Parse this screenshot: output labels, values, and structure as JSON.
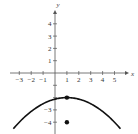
{
  "chart_data": {
    "type": "line",
    "title": "",
    "xlabel": "x",
    "ylabel": "y",
    "xlim": [
      -3.5,
      5.8
    ],
    "ylim": [
      -4.7,
      5
    ],
    "x_ticks": [
      -3,
      -2,
      -1,
      1,
      2,
      3,
      4,
      5
    ],
    "x_tick_labels": [
      "−3",
      "−2",
      "−1",
      "1",
      "2",
      "3",
      "4",
      "5"
    ],
    "y_ticks": [
      -4,
      -3,
      -2,
      -1,
      1,
      2,
      3,
      4
    ],
    "y_tick_labels_shown": [
      {
        "value": 4,
        "label": "4"
      },
      {
        "value": 3,
        "label": "3"
      },
      {
        "value": 2,
        "label": "2"
      },
      {
        "value": 1,
        "label": "1"
      },
      {
        "value": -3,
        "label": "−3"
      },
      {
        "value": -4,
        "label": "−4"
      }
    ],
    "grid": false,
    "series": [
      {
        "name": "parabola",
        "equation": "y = -(1/8)(x-1)^2 - 2",
        "vertex": [
          1,
          -2
        ],
        "x_range": [
          -3.5,
          5.5
        ]
      }
    ],
    "points": [
      {
        "x": 1,
        "y": -2,
        "label": "vertex"
      },
      {
        "x": 1,
        "y": -4,
        "label": "point"
      }
    ]
  }
}
